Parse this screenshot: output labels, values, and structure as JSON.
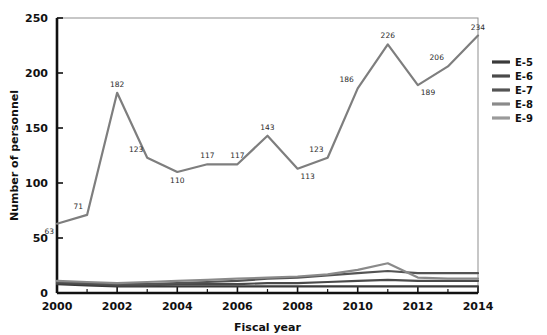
{
  "chart_data": {
    "type": "line",
    "title": "",
    "xlabel": "Fiscal year",
    "ylabel": "Number of personnel",
    "x": [
      2000,
      2001,
      2002,
      2003,
      2004,
      2005,
      2006,
      2007,
      2008,
      2009,
      2010,
      2011,
      2012,
      2013,
      2014
    ],
    "xlim": [
      2000,
      2014
    ],
    "ylim": [
      0,
      250
    ],
    "xticks": [
      2000,
      2002,
      2004,
      2006,
      2008,
      2010,
      2012,
      2014
    ],
    "xtick_labels": [
      "2000",
      "2002",
      "2004",
      "2006",
      "2008",
      "2010",
      "2012",
      "2014"
    ],
    "xminor_ticks": [
      2001,
      2003,
      2005,
      2007,
      2009,
      2011,
      2013
    ],
    "yticks": [
      0,
      50,
      100,
      150,
      200,
      250
    ],
    "ytick_labels": [
      "0",
      "50",
      "100",
      "150",
      "200",
      "250"
    ],
    "grid": false,
    "legend_position": "right",
    "series": [
      {
        "name": "E-5",
        "color": "#3a3a3a",
        "values": [
          8,
          7,
          6,
          6,
          6,
          6,
          6,
          6,
          6,
          6,
          6,
          6,
          6,
          6,
          6
        ],
        "labels": []
      },
      {
        "name": "E-6",
        "color": "#4a4a4a",
        "values": [
          9,
          8,
          7,
          7,
          8,
          8,
          8,
          9,
          9,
          10,
          11,
          12,
          11,
          11,
          11
        ],
        "labels": []
      },
      {
        "name": "E-7",
        "color": "#545454",
        "values": [
          10,
          9,
          8,
          8,
          9,
          10,
          11,
          13,
          14,
          16,
          18,
          20,
          18,
          18,
          18
        ],
        "labels": []
      },
      {
        "name": "E-8",
        "color": "#8a8a8a",
        "values": [
          11,
          10,
          9,
          10,
          11,
          12,
          13,
          14,
          15,
          17,
          21,
          27,
          14,
          13,
          13
        ],
        "labels": []
      },
      {
        "name": "E-9",
        "color": "#7e7e7e",
        "values": [
          63,
          71,
          182,
          123,
          110,
          117,
          117,
          143,
          113,
          123,
          186,
          226,
          189,
          206,
          234
        ],
        "labels": [
          "63",
          "71",
          "182",
          "123",
          "110",
          "117",
          "117",
          "143",
          "113",
          "123",
          "186",
          "226",
          "189",
          "206",
          "234"
        ],
        "label_positions": [
          "below-left",
          "above-left",
          "above",
          "above-left",
          "below",
          "above",
          "above",
          "above",
          "below-right",
          "above-left",
          "above-left",
          "above",
          "below-right",
          "above-left",
          "above"
        ]
      }
    ]
  },
  "axis": {
    "ylabel": "Number of personnel",
    "xlabel": "Fiscal year"
  },
  "legend": {
    "entries": [
      {
        "label": "E-5",
        "color": "#3a3a3a"
      },
      {
        "label": "E-6",
        "color": "#4a4a4a"
      },
      {
        "label": "E-7",
        "color": "#545454"
      },
      {
        "label": "E-8",
        "color": "#8a8a8a"
      },
      {
        "label": "E-9",
        "color": "#9a9a9a"
      }
    ]
  },
  "colors": {
    "axis": "#111111",
    "plot_border": "#8f8f8f",
    "background": "#ffffff",
    "label_text": "#2b2b2b"
  }
}
